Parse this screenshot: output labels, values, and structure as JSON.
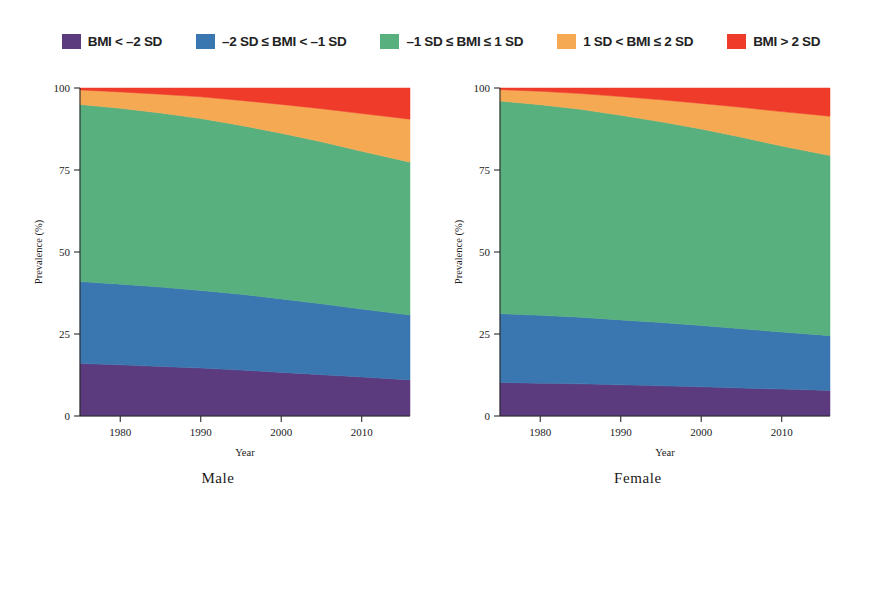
{
  "legend": {
    "items": [
      {
        "label": "BMI < –2 SD",
        "color": "#5c3a7e",
        "icon": "legend-swatch-icon"
      },
      {
        "label": "–2 SD ≤ BMI < –1 SD",
        "color": "#3a77b0",
        "icon": "legend-swatch-icon"
      },
      {
        "label": "–1 SD ≤ BMI ≤ 1 SD",
        "color": "#57b07e",
        "icon": "legend-swatch-icon"
      },
      {
        "label": "1 SD < BMI ≤ 2 SD",
        "color": "#f6a953",
        "icon": "legend-swatch-icon"
      },
      {
        "label": "BMI > 2 SD",
        "color": "#ee3b2a",
        "icon": "legend-swatch-icon"
      }
    ]
  },
  "panels": [
    {
      "caption": "Male"
    },
    {
      "caption": "Female"
    }
  ],
  "chart_data": [
    {
      "type": "area",
      "title": "Male",
      "stacked": true,
      "percent_stacked": true,
      "xlabel": "Year",
      "ylabel": "Prevalence (%)",
      "xlim": [
        1975,
        2016
      ],
      "ylim": [
        0,
        100
      ],
      "xticks": [
        1980,
        1990,
        2000,
        2010
      ],
      "xticklabels": [
        "1980",
        "1990",
        "2000",
        "2010"
      ],
      "yticks": [
        0,
        25,
        50,
        75,
        100
      ],
      "yticklabels": [
        "0",
        "25",
        "50",
        "75",
        "100"
      ],
      "grid": false,
      "legend_position": "top",
      "x": [
        1975,
        1980,
        1985,
        1990,
        1995,
        2000,
        2005,
        2010,
        2016
      ],
      "series": [
        {
          "name": "BMI < –2 SD",
          "color": "#5c3a7e",
          "values": [
            16.0,
            15.6,
            15.1,
            14.6,
            14.0,
            13.3,
            12.6,
            11.9,
            11.0
          ]
        },
        {
          "name": "–2 SD ≤ BMI < –1 SD",
          "color": "#3a77b0",
          "values": [
            25.0,
            24.6,
            24.2,
            23.7,
            23.1,
            22.4,
            21.6,
            20.7,
            19.8
          ]
        },
        {
          "name": "–1 SD ≤ BMI ≤ 1 SD",
          "color": "#57b07e",
          "values": [
            54.0,
            53.6,
            53.1,
            52.4,
            51.5,
            50.5,
            49.4,
            48.1,
            46.6
          ]
        },
        {
          "name": "1 SD < BMI ≤ 2 SD",
          "color": "#f6a953",
          "values": [
            4.4,
            5.0,
            5.7,
            6.6,
            7.6,
            8.8,
            10.1,
            11.5,
            13.1
          ]
        },
        {
          "name": "BMI > 2 SD",
          "color": "#ee3b2a",
          "values": [
            0.6,
            1.2,
            1.9,
            2.7,
            3.8,
            5.0,
            6.3,
            7.8,
            9.5
          ]
        }
      ],
      "cumulative_boundaries": {
        "note": "upper edge of each stacked band, in percent",
        "b1": [
          16.0,
          15.6,
          15.1,
          14.6,
          14.0,
          13.3,
          12.6,
          11.9,
          11.0
        ],
        "b2": [
          41.0,
          40.2,
          39.3,
          38.3,
          37.1,
          35.7,
          34.2,
          32.6,
          30.8
        ],
        "b3": [
          95.0,
          93.8,
          92.4,
          90.7,
          88.6,
          86.2,
          83.6,
          80.7,
          77.4
        ],
        "b4": [
          99.4,
          98.8,
          98.1,
          97.3,
          96.2,
          95.0,
          93.7,
          92.2,
          90.5
        ],
        "b5": [
          100,
          100,
          100,
          100,
          100,
          100,
          100,
          100,
          100
        ]
      }
    },
    {
      "type": "area",
      "title": "Female",
      "stacked": true,
      "percent_stacked": true,
      "xlabel": "Year",
      "ylabel": "Prevalence (%)",
      "xlim": [
        1975,
        2016
      ],
      "ylim": [
        0,
        100
      ],
      "xticks": [
        1980,
        1990,
        2000,
        2010
      ],
      "xticklabels": [
        "1980",
        "1990",
        "2000",
        "2010"
      ],
      "yticks": [
        0,
        25,
        50,
        75,
        100
      ],
      "yticklabels": [
        "0",
        "25",
        "50",
        "75",
        "100"
      ],
      "grid": false,
      "legend_position": "top",
      "x": [
        1975,
        1980,
        1985,
        1990,
        1995,
        2000,
        2005,
        2010,
        2016
      ],
      "series": [
        {
          "name": "BMI < –2 SD",
          "color": "#5c3a7e",
          "values": [
            10.2,
            10.0,
            9.8,
            9.5,
            9.2,
            8.9,
            8.5,
            8.2,
            7.8
          ]
        },
        {
          "name": "–2 SD ≤ BMI < –1 SD",
          "color": "#3a77b0",
          "values": [
            21.0,
            20.7,
            20.3,
            19.8,
            19.3,
            18.7,
            18.1,
            17.4,
            16.7
          ]
        },
        {
          "name": "–1 SD ≤ BMI ≤ 1 SD",
          "color": "#57b07e",
          "values": [
            64.8,
            64.2,
            63.4,
            62.4,
            61.2,
            59.9,
            58.4,
            56.7,
            54.9
          ]
        },
        {
          "name": "1 SD < BMI ≤ 2 SD",
          "color": "#f6a953",
          "values": [
            3.5,
            4.1,
            4.8,
            5.7,
            6.7,
            7.8,
            9.1,
            10.5,
            12.0
          ]
        },
        {
          "name": "BMI > 2 SD",
          "color": "#ee3b2a",
          "values": [
            0.5,
            1.0,
            1.7,
            2.6,
            3.6,
            4.7,
            5.9,
            7.2,
            8.6
          ]
        }
      ],
      "cumulative_boundaries": {
        "note": "upper edge of each stacked band, in percent",
        "b1": [
          10.2,
          10.0,
          9.8,
          9.5,
          9.2,
          8.9,
          8.5,
          8.2,
          7.8
        ],
        "b2": [
          31.2,
          30.7,
          30.1,
          29.3,
          28.5,
          27.6,
          26.6,
          25.6,
          24.5
        ],
        "b3": [
          96.0,
          94.9,
          93.5,
          91.7,
          89.7,
          87.5,
          85.0,
          82.3,
          79.4
        ],
        "b4": [
          99.5,
          99.0,
          98.3,
          97.4,
          96.4,
          95.3,
          94.1,
          92.8,
          91.4
        ],
        "b5": [
          100,
          100,
          100,
          100,
          100,
          100,
          100,
          100,
          100
        ]
      }
    }
  ]
}
